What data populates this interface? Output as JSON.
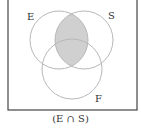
{
  "diagram": {
    "type": "venn",
    "sets": [
      {
        "label": "E",
        "cx": 59,
        "cy": 40,
        "r": 29
      },
      {
        "label": "S",
        "cx": 84,
        "cy": 40,
        "r": 29
      },
      {
        "label": "F",
        "cx": 72,
        "cy": 69,
        "r": 30
      }
    ],
    "shaded_region": "E ∩ S",
    "shade_color": "#d0d0d0",
    "circle_color": "#b8b8b8",
    "caption": "(E ∩ S)"
  }
}
